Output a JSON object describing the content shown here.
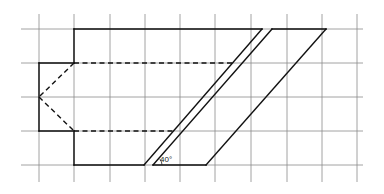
{
  "diagram": {
    "type": "technical-drawing",
    "colors": {
      "background": "#ffffff",
      "grid": "#8a8a8a",
      "lines": "#111111"
    },
    "grid": {
      "x_lines": [
        39,
        74,
        110,
        145,
        180,
        215,
        251,
        287,
        322,
        357
      ],
      "y_lines": [
        29,
        63,
        97,
        131,
        165
      ],
      "x_extent": [
        21,
        363
      ],
      "y_extent": [
        14,
        182
      ]
    },
    "shapes": {
      "outline_top": {
        "x1": 74,
        "y1": 29,
        "x2": 262,
        "y2": 29
      },
      "step_top_vertical": {
        "x1": 74,
        "y1": 29,
        "x2": 74,
        "y2": 63
      },
      "step_top_horizontal": {
        "x1": 39,
        "y1": 63,
        "x2": 74,
        "y2": 63
      },
      "left_vertical": {
        "x1": 39,
        "y1": 63,
        "x2": 39,
        "y2": 131
      },
      "step_bottom_horizontal": {
        "x1": 39,
        "y1": 131,
        "x2": 74,
        "y2": 131
      },
      "step_bottom_vertical": {
        "x1": 74,
        "y1": 131,
        "x2": 74,
        "y2": 165
      },
      "outline_bottom": {
        "x1": 74,
        "y1": 165,
        "x2": 144,
        "y2": 165
      },
      "slant_1": {
        "x1": 144,
        "y1": 165,
        "x2": 262,
        "y2": 29
      },
      "slant_2": {
        "x1": 153,
        "y1": 165,
        "x2": 272,
        "y2": 29
      },
      "slant_3": {
        "x1": 206,
        "y1": 165,
        "x2": 326,
        "y2": 29
      },
      "top_right_segment": {
        "x1": 272,
        "y1": 29,
        "x2": 326,
        "y2": 29
      },
      "bottom_right_segment": {
        "x1": 153,
        "y1": 165,
        "x2": 206,
        "y2": 165
      },
      "hidden_upper": {
        "x1": 74,
        "y1": 63,
        "x2": 233,
        "y2": 63
      },
      "hidden_lower": {
        "x1": 74,
        "y1": 131,
        "x2": 173,
        "y2": 131
      },
      "hidden_diag_upper": {
        "x1": 74,
        "y1": 63,
        "x2": 39,
        "y2": 97
      },
      "hidden_diag_lower": {
        "x1": 39,
        "y1": 97,
        "x2": 74,
        "y2": 131
      }
    },
    "angle": {
      "label": "40°",
      "label_x": 160,
      "label_y": 162,
      "arc_cx": 153,
      "arc_cy": 165,
      "arc_r": 9
    }
  }
}
